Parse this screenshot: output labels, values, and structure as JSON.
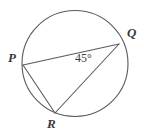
{
  "figure": {
    "name": "circle-with-inscribed-angle",
    "background_color": "#ffffff",
    "stroke_color": "#5a5a5a",
    "label_color": "#3a3a3a",
    "circle": {
      "center_x": 75,
      "center_y": 63.5,
      "radius": 53
    },
    "points": {
      "P": {
        "label": "P",
        "x": 23,
        "y": 65
      },
      "Q": {
        "label": "Q",
        "x": 119,
        "y": 44
      },
      "R": {
        "label": "R",
        "x": 55,
        "y": 113
      }
    },
    "chords": [
      {
        "name": "chord-PQ",
        "from": "P",
        "to": "Q"
      },
      {
        "name": "chord-QR",
        "from": "Q",
        "to": "R"
      },
      {
        "name": "chord-PR",
        "from": "P",
        "to": "R"
      }
    ],
    "angles": [
      {
        "name": "angle-PQR",
        "vertex": "Q",
        "measure_text": "45°",
        "value": 45,
        "unit": "degrees"
      }
    ]
  }
}
